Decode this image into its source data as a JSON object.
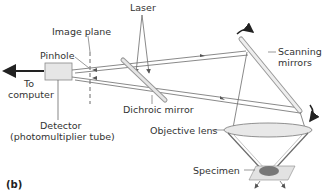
{
  "diagram": {
    "type": "confocal-microscope-schematic",
    "panel_label": "(b)",
    "labels": {
      "laser": "Laser",
      "image_plane": "Image plane",
      "pinhole": "Pinhole",
      "to_computer_line1": "To",
      "to_computer_line2": "computer",
      "scanning_mirrors_line1": "Scanning",
      "scanning_mirrors_line2": "mirrors",
      "dichroic_mirror": "Dichroic mirror",
      "objective_lens": "Objective lens",
      "detector_line1": "Detector",
      "detector_line2": "(photomultiplier tube)",
      "specimen": "Specimen"
    },
    "colors": {
      "beam": "#6b6b6b",
      "text": "#333333",
      "lens_fill": "#e8e8e8",
      "detector_fill": "#e6e6e6",
      "specimen_fill": "#777777",
      "slide_fill": "#e2e2e2"
    }
  }
}
